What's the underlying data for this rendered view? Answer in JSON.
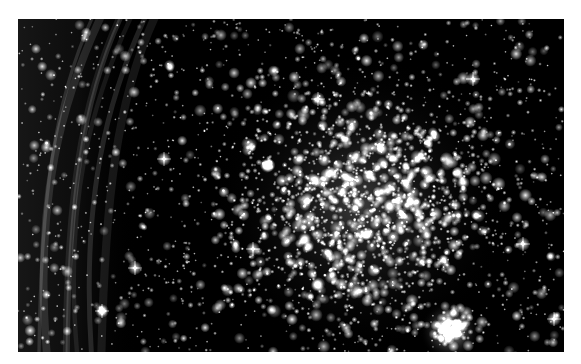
{
  "page": {
    "caption_remnant": "",
    "background": "#ffffff"
  },
  "image": {
    "subject": "star cluster with nebula filaments",
    "alt": "Grayscale astronomical photograph of a dense open star cluster with a wispy nebula filament along the left edge",
    "color_mode": "grayscale",
    "frame": {
      "x": 18,
      "y": 19,
      "width": 546,
      "height": 333
    },
    "cluster_center": {
      "x": 342,
      "y": 185
    },
    "secondary_knot": {
      "x": 432,
      "y": 312
    },
    "nebula_region": {
      "x_start": 0,
      "x_end": 110
    },
    "colors": {
      "sky": "#000000",
      "star": "#ffffff",
      "nebula": "#9a9a9a"
    }
  }
}
